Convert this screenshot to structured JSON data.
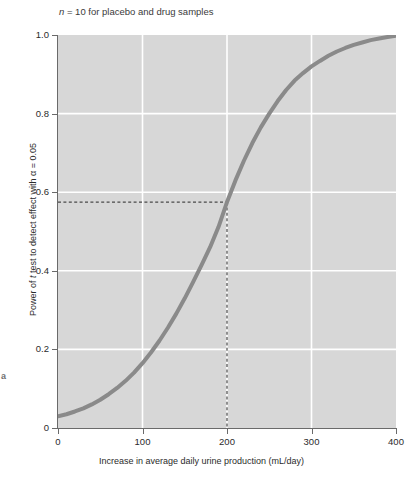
{
  "figure": {
    "panel_letter": "a"
  },
  "chart_data": {
    "type": "line",
    "title": "n = 10 for placebo and drug samples",
    "title_italic_token": "n",
    "xlabel": "Increase in average daily urine production (mL/day)",
    "ylabel_prefix": "Power of ",
    "ylabel_italic_token": "t",
    "ylabel_suffix": " test to detect effect with α = 0.05",
    "ylabel_full": "Power of t test to detect effect with α = 0.05",
    "xlim": [
      0,
      400
    ],
    "ylim": [
      0,
      1.0
    ],
    "xticks": [
      0,
      100,
      200,
      300,
      400
    ],
    "xtick_labels": [
      "0",
      "100",
      "200",
      "300",
      "400"
    ],
    "yticks": [
      0,
      0.2,
      0.4,
      0.6,
      0.8,
      1.0
    ],
    "ytick_labels": [
      "0",
      "0.2",
      "0.4",
      "0.6",
      "0.8",
      "1.0"
    ],
    "grid": true,
    "grid_color": "#ffffff",
    "plot_background": "#d7d7d7",
    "legend": null,
    "series": [
      {
        "name": "Power curve",
        "color": "#8a8a8a",
        "line_width": 4,
        "x": [
          0,
          10,
          20,
          30,
          40,
          50,
          60,
          70,
          80,
          90,
          100,
          110,
          120,
          130,
          140,
          150,
          160,
          170,
          180,
          190,
          200,
          210,
          220,
          230,
          240,
          250,
          260,
          270,
          280,
          290,
          300,
          310,
          320,
          330,
          340,
          350,
          360,
          370,
          380,
          390,
          400
        ],
        "y": [
          0.03,
          0.035,
          0.042,
          0.05,
          0.06,
          0.072,
          0.086,
          0.102,
          0.12,
          0.141,
          0.165,
          0.192,
          0.222,
          0.255,
          0.291,
          0.33,
          0.372,
          0.415,
          0.46,
          0.512,
          0.575,
          0.63,
          0.68,
          0.725,
          0.765,
          0.8,
          0.832,
          0.86,
          0.884,
          0.903,
          0.92,
          0.934,
          0.947,
          0.958,
          0.967,
          0.975,
          0.981,
          0.987,
          0.991,
          0.995,
          0.998
        ]
      }
    ],
    "annotations": [
      {
        "name": "reference-lines",
        "style": "dashed",
        "color": "#4a4a4a",
        "x_value": 200,
        "y_value": 0.575,
        "description": "Dashed guides marking power at an increase of 200 mL/day"
      }
    ]
  }
}
